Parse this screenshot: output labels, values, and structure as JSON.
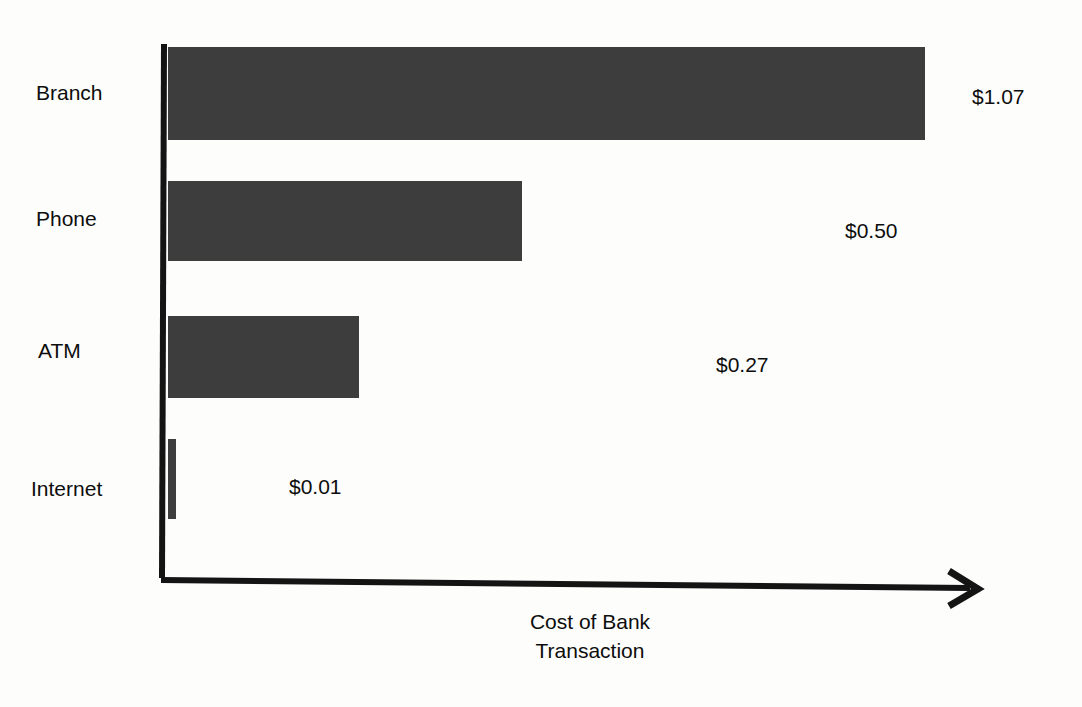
{
  "chart_data": {
    "type": "bar",
    "orientation": "horizontal",
    "title": "",
    "subtitle": "",
    "xlabel": "Cost of Bank Transaction",
    "xlabel_lines": [
      "Cost of Bank",
      "Transaction"
    ],
    "ylabel": "",
    "categories": [
      "Branch",
      "Phone",
      "ATM",
      "Internet"
    ],
    "values": [
      1.07,
      0.5,
      0.27,
      0.01
    ],
    "value_labels": [
      "$1.07",
      "$0.50",
      "$0.27",
      "$0.01"
    ],
    "units": "USD",
    "xlim": [
      0,
      1.15
    ],
    "grid": false,
    "legend": false,
    "tick_labels": [],
    "bar_color": "#3d3d3d",
    "axis_color": "#141414",
    "background_color": "#fdfdfc",
    "text_color": "#0d0d0d",
    "axis_arrow": "arrow-right-icon"
  },
  "axis": {
    "y_axis_name": "y-axis-line",
    "x_axis_name": "x-axis-line",
    "arrow_name": "x-axis-arrow-icon"
  }
}
